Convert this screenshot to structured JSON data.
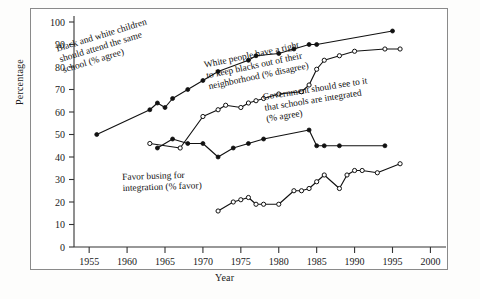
{
  "figure": {
    "ylabel": "Percentage",
    "xlabel": "Year"
  },
  "annotations": {
    "a1": "Black and white children\nshould attend the same\nschool (% agree)",
    "a2": "White people have a right\nto keep blacks out of their\nneighborhood (% disagree)",
    "a3": "Government should see to it\nthat schools are integrated\n(% agree)",
    "a4": "Favor busing for\nintegration (% favor)"
  },
  "chart_data": {
    "type": "line",
    "title": "",
    "xlabel": "Year",
    "ylabel": "Percentage",
    "xlim": [
      1953,
      2001
    ],
    "ylim": [
      0,
      100
    ],
    "xticks": [
      1955,
      1960,
      1965,
      1970,
      1975,
      1980,
      1985,
      1990,
      1995,
      2000
    ],
    "yticks": [
      0,
      10,
      20,
      30,
      40,
      50,
      60,
      70,
      80,
      90,
      100
    ],
    "grid": false,
    "legend": "inline-annotations",
    "series": [
      {
        "name": "Black and white children should attend the same school (% agree)",
        "marker": "filled-circle",
        "points": [
          [
            1956,
            50
          ],
          [
            1963,
            61
          ],
          [
            1964,
            64
          ],
          [
            1965,
            62
          ],
          [
            1966,
            66
          ],
          [
            1968,
            70
          ],
          [
            1970,
            74
          ],
          [
            1972,
            78
          ],
          [
            1976,
            83
          ],
          [
            1977,
            85
          ],
          [
            1980,
            86
          ],
          [
            1982,
            88
          ],
          [
            1984,
            90
          ],
          [
            1985,
            90
          ],
          [
            1995,
            96
          ]
        ]
      },
      {
        "name": "White people have a right to keep blacks out of their neighborhood (% disagree)",
        "marker": "open-circle",
        "points": [
          [
            1963,
            46
          ],
          [
            1967,
            44
          ],
          [
            1970,
            58
          ],
          [
            1972,
            61
          ],
          [
            1973,
            63
          ],
          [
            1975,
            62
          ],
          [
            1976,
            64
          ],
          [
            1977,
            65
          ],
          [
            1978,
            66
          ],
          [
            1980,
            68
          ],
          [
            1983,
            69
          ],
          [
            1984,
            72
          ],
          [
            1985,
            79
          ],
          [
            1986,
            83
          ],
          [
            1988,
            85
          ],
          [
            1990,
            87
          ],
          [
            1994,
            88
          ],
          [
            1996,
            88
          ]
        ]
      },
      {
        "name": "Government should see to it that schools are integrated (% agree)",
        "marker": "filled-circle",
        "points": [
          [
            1964,
            44
          ],
          [
            1966,
            48
          ],
          [
            1968,
            46
          ],
          [
            1970,
            46
          ],
          [
            1972,
            40
          ],
          [
            1974,
            44
          ],
          [
            1976,
            46
          ],
          [
            1978,
            48
          ],
          [
            1984,
            52
          ],
          [
            1985,
            45
          ],
          [
            1986,
            45
          ],
          [
            1988,
            45
          ],
          [
            1994,
            45
          ]
        ]
      },
      {
        "name": "Favor busing for integration (% favor)",
        "marker": "open-circle",
        "points": [
          [
            1972,
            16
          ],
          [
            1974,
            20
          ],
          [
            1975,
            21
          ],
          [
            1976,
            22
          ],
          [
            1977,
            19
          ],
          [
            1978,
            19
          ],
          [
            1980,
            19
          ],
          [
            1982,
            25
          ],
          [
            1983,
            25
          ],
          [
            1984,
            26
          ],
          [
            1985,
            29
          ],
          [
            1986,
            32
          ],
          [
            1988,
            26
          ],
          [
            1989,
            32
          ],
          [
            1990,
            34
          ],
          [
            1991,
            34
          ],
          [
            1993,
            33
          ],
          [
            1996,
            37
          ]
        ]
      }
    ]
  }
}
